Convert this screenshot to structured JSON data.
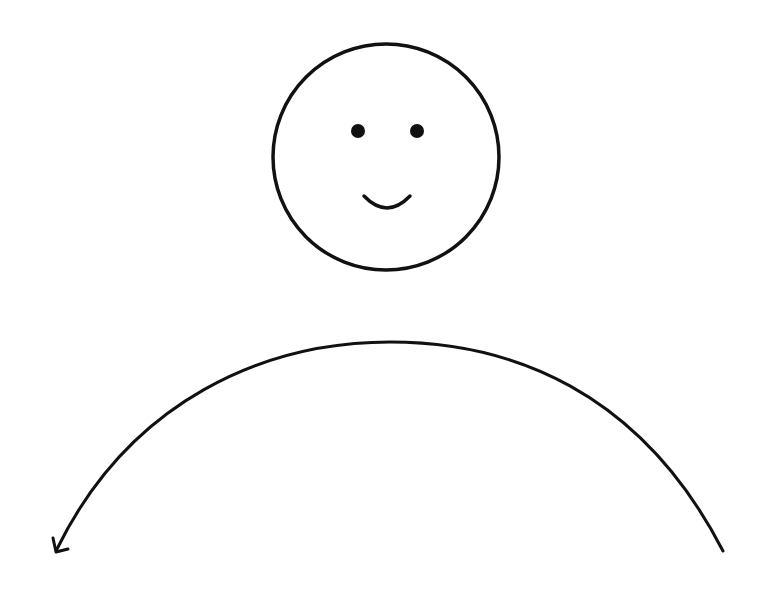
{
  "canvas": {
    "width": 774,
    "height": 602,
    "background": "#ffffff",
    "ink_color": "#111111"
  },
  "diagram": {
    "face": {
      "icon": "smiley-face-icon",
      "center": [
        386,
        157
      ],
      "radius": 113,
      "stroke_width": 3.5,
      "left_eye": {
        "center": [
          358,
          131
        ],
        "radius": 7
      },
      "right_eye": {
        "center": [
          417,
          131
        ],
        "radius": 7
      },
      "smile": {
        "start": [
          364,
          196
        ],
        "end": [
          410,
          196
        ],
        "depth": 14,
        "stroke_width": 3.5
      }
    },
    "arc": {
      "icon": "curved-arrow-icon",
      "start": [
        723,
        551
      ],
      "peak": [
        390,
        342
      ],
      "end": [
        56,
        551
      ],
      "stroke_width": 3,
      "arrowhead_at": "left-end"
    }
  }
}
